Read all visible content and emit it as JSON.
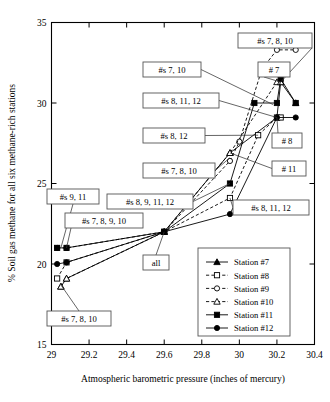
{
  "chart_data": {
    "type": "line",
    "title": "",
    "xlabel": "Atmospheric barometric pressure (inches of mercury)",
    "ylabel": "% Soil gas methane for all six methane-rich stations",
    "xlim": [
      29,
      30.4
    ],
    "ylim": [
      15,
      35
    ],
    "xticks": [
      "29",
      "29.2",
      "29.4",
      "29.6",
      "29.8",
      "30",
      "30.2",
      "30.4"
    ],
    "xtick_values": [
      29,
      29.2,
      29.4,
      29.6,
      29.8,
      30,
      30.2,
      30.4
    ],
    "yticks": [
      "15",
      "20",
      "25",
      "30",
      "35"
    ],
    "ytick_values": [
      15,
      20,
      25,
      30,
      35
    ],
    "grid": false,
    "legend_position": "lower right",
    "series": [
      {
        "name": "Station #7",
        "marker": "filled-triangle",
        "line": "solid",
        "points": [
          [
            29.05,
            18.6
          ],
          [
            29.08,
            19.1
          ],
          [
            29.6,
            22.0
          ],
          [
            29.95,
            26.9
          ],
          [
            30.2,
            29.1
          ],
          [
            30.22,
            31.3
          ],
          [
            30.3,
            30.0
          ]
        ]
      },
      {
        "name": "Station #8",
        "marker": "open-square",
        "line": "dashed",
        "points": [
          [
            29.03,
            19.1
          ],
          [
            29.08,
            20.1
          ],
          [
            29.6,
            22.0
          ],
          [
            29.95,
            24.1
          ],
          [
            30.1,
            28.0
          ],
          [
            30.2,
            29.1
          ],
          [
            30.22,
            29.1
          ]
        ]
      },
      {
        "name": "Station #9",
        "marker": "open-circle",
        "line": "dashed",
        "points": [
          [
            29.03,
            21.0
          ],
          [
            29.08,
            21.0
          ],
          [
            29.6,
            22.0
          ],
          [
            29.95,
            26.4
          ],
          [
            30.0,
            27.6
          ],
          [
            30.12,
            32.1
          ],
          [
            30.2,
            33.3
          ],
          [
            30.3,
            33.3
          ]
        ]
      },
      {
        "name": "Station #10",
        "marker": "open-triangle",
        "line": "dashed",
        "points": [
          [
            29.05,
            18.6
          ],
          [
            29.08,
            19.1
          ],
          [
            29.6,
            22.0
          ],
          [
            29.95,
            26.9
          ],
          [
            30.2,
            31.3
          ],
          [
            30.22,
            31.3
          ]
        ]
      },
      {
        "name": "Station #11",
        "marker": "filled-square",
        "line": "solid",
        "points": [
          [
            29.03,
            21.0
          ],
          [
            29.08,
            21.0
          ],
          [
            29.6,
            22.0
          ],
          [
            29.95,
            25.0
          ],
          [
            30.08,
            30.0
          ],
          [
            30.2,
            30.0
          ],
          [
            30.22,
            31.5
          ],
          [
            30.3,
            30.0
          ]
        ]
      },
      {
        "name": "Station #12",
        "marker": "filled-circle",
        "line": "solid",
        "points": [
          [
            29.03,
            20.0
          ],
          [
            29.08,
            20.1
          ],
          [
            29.6,
            22.0
          ],
          [
            29.95,
            23.1
          ],
          [
            30.2,
            29.1
          ],
          [
            30.3,
            29.1
          ]
        ]
      }
    ],
    "annotations": [
      {
        "text": "#s 7, 8, 10",
        "target": [
          30.22,
          31.3
        ]
      },
      {
        "text": "# 7",
        "target": [
          30.22,
          31.3
        ]
      },
      {
        "text": "#s 7, 10",
        "target": [
          30.18,
          29.9
        ]
      },
      {
        "text": "#s 8, 11, 12",
        "target": [
          30.2,
          29.1
        ]
      },
      {
        "text": "#s  8, 12",
        "target": [
          30.1,
          28.0
        ]
      },
      {
        "text": "# 8",
        "target": [
          30.2,
          29.1
        ]
      },
      {
        "text": "#s 7, 8, 10",
        "target": [
          29.95,
          26.6
        ]
      },
      {
        "text": "# 11",
        "target": [
          29.95,
          26.9
        ]
      },
      {
        "text": "#s 8, 9, 11, 12",
        "target": [
          29.95,
          25.0
        ]
      },
      {
        "text": "#s 8, 11, 12",
        "target": [
          29.95,
          24.1
        ]
      },
      {
        "text": "#s 9, 11",
        "target": [
          29.05,
          21.0
        ]
      },
      {
        "text": "#s 7, 8, 9, 10",
        "target": [
          29.08,
          21.0
        ]
      },
      {
        "text": "all",
        "target": [
          29.6,
          22.0
        ]
      },
      {
        "text": "#s 7, 8, 10",
        "target": [
          29.05,
          18.7
        ]
      }
    ]
  },
  "legend": {
    "items": [
      {
        "label": "Station #7"
      },
      {
        "label": "Station #8"
      },
      {
        "label": "Station #9"
      },
      {
        "label": "Station #10"
      },
      {
        "label": "Station #11"
      },
      {
        "label": "Station #12"
      }
    ]
  }
}
